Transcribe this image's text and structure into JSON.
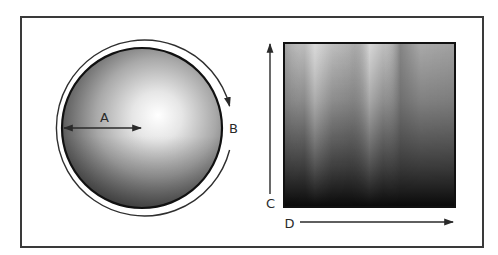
{
  "figure": {
    "frame": {
      "x": 21,
      "y": 17,
      "width": 462,
      "height": 230,
      "stroke": "#3a3a3a"
    },
    "left_panel": {
      "shape": "sphere-cross-section",
      "center": {
        "x": 142,
        "y": 128
      },
      "inner_radius": 80,
      "outer_arc_radius": 88,
      "highlight_color": "#ffffff",
      "shadow_color": "#4a4a4a",
      "labels": {
        "radius": "A",
        "circumference": "B"
      },
      "arrows": {
        "radius": {
          "description": "double-headed arrow from edge to center",
          "from_x": 64,
          "to_x": 141,
          "y": 128
        },
        "circumference": {
          "description": "arc arrow around the circle, gap at right for label B"
        }
      }
    },
    "right_panel": {
      "shape": "square-gradient",
      "rect": {
        "x": 284,
        "y": 43,
        "width": 171,
        "height": 164
      },
      "top_color": "#c8c8c8",
      "bottom_color": "#0c0c0c",
      "labels": {
        "vertical_axis": "C",
        "horizontal_axis": "D"
      },
      "arrows": {
        "vertical": {
          "x": 270,
          "from_y": 194,
          "to_y": 43,
          "direction": "up"
        },
        "horizontal": {
          "y": 222,
          "from_x": 300,
          "to_x": 453,
          "direction": "right"
        }
      }
    }
  }
}
